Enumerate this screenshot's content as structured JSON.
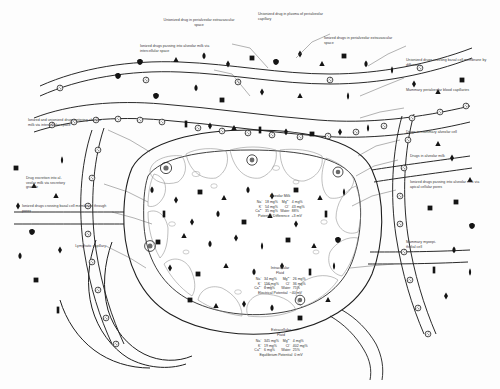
{
  "figure": {
    "ink": "#1a1a1a",
    "leader": "#4a4a4a",
    "paper": "#fdfdfd"
  },
  "labels": [
    {
      "id": "unionized-perialveolar-extravascular",
      "text": "Unionized drug in perialveolar extravascular space"
    },
    {
      "id": "ionized-intercellular",
      "text": "Ionized drugs passing into alveolar milk via intercellular space"
    },
    {
      "id": "unionized-plasma-capillary",
      "text": "Unionized drug in plasma of perialveolar capillary"
    },
    {
      "id": "ionized-perialveolar-extravascular",
      "text": "Ionized drugs in perialveolar extravascular space"
    },
    {
      "id": "unionized-basal-diffusion",
      "text": "Unionized drugs crossing basal cell membrane by diffusion"
    },
    {
      "id": "mammary-blood-capillaries",
      "text": "Mammary perialveolar blood capillaries"
    },
    {
      "id": "drugs-mammary-alveolar-cell",
      "text": "Drugs in mammary alveolar cell"
    },
    {
      "id": "drugs-alveolar-milk",
      "text": "Drugs in alveolar milk"
    },
    {
      "id": "ionized-apical-pores",
      "text": "Ionized drugs passing into alveolar milk via apical cellular pores"
    },
    {
      "id": "mammary-myoepithelial-cell",
      "text": "Mammary myoepi-\nthelial cell"
    },
    {
      "id": "ionized-unionized-intercellular",
      "text": "Ionized and unionized drugs entering alveolar milk via intercellular space"
    },
    {
      "id": "drug-secretion-granule",
      "text": "Drug excretion into al-\nveolar milk via secretory\ngranule"
    },
    {
      "id": "ionized-basal-pores",
      "text": "Ionized drugs crossing basal cell membrane through pores"
    },
    {
      "id": "lymphatic-capillary",
      "text": "Lymphatic capillary"
    }
  ],
  "compartments": [
    {
      "id": "alveolar-milk",
      "title": "Alveolar Milk",
      "ions": [
        {
          "name": "Na",
          "charge": "+",
          "value": "18 mg%"
        },
        {
          "name": "Mg",
          "charge": "2+",
          "value": "4 mg%"
        },
        {
          "name": "K",
          "charge": "+",
          "value": "54 mg%"
        },
        {
          "name": "Cl",
          "charge": "−",
          "value": "43 mg%"
        },
        {
          "name": "Ca",
          "charge": "2+",
          "value": "35 mg%"
        },
        {
          "name": "Water",
          "charge": "",
          "value": "88%"
        }
      ],
      "potential_label": "Potential Difference",
      "potential_value": "+3 mV"
    },
    {
      "id": "intracellular-fluid",
      "title": "Intracellular\nFluid",
      "ions": [
        {
          "name": "Na",
          "charge": "+",
          "value": "34 mg%"
        },
        {
          "name": "Mg",
          "charge": "2+",
          "value": "26 mg%"
        },
        {
          "name": "K",
          "charge": "+",
          "value": "156 mg%"
        },
        {
          "name": "Cl",
          "charge": "−",
          "value": "36 mg%"
        },
        {
          "name": "Ca",
          "charge": "2+",
          "value": "6 mg%"
        },
        {
          "name": "Water",
          "charge": "",
          "value": "75%"
        }
      ],
      "potential_label": "Electrical Potential",
      "potential_value": "−40 mV"
    },
    {
      "id": "extracellular-fluid",
      "title": "Extracellular\nFluid",
      "ions": [
        {
          "name": "Na",
          "charge": "+",
          "value": "345 mg%"
        },
        {
          "name": "Mg",
          "charge": "2+",
          "value": "4 mg%"
        },
        {
          "name": "K",
          "charge": "+",
          "value": "19 mg%"
        },
        {
          "name": "Cl",
          "charge": "−",
          "value": "402 mg%"
        },
        {
          "name": "Ca",
          "charge": "2+",
          "value": "6 mg%"
        },
        {
          "name": "Water",
          "charge": "",
          "value": "25%"
        }
      ],
      "potential_label": "Equilibrium Potential",
      "potential_value": "0 mV"
    }
  ],
  "symbol_legend": [
    {
      "id": "circle-nucleus",
      "shape": "circle-textured",
      "meaning": "cell nucleus"
    },
    {
      "id": "triangle",
      "shape": "triangle",
      "meaning": "drug molecule form A"
    },
    {
      "id": "diamond",
      "shape": "diamond",
      "meaning": "drug molecule form B"
    },
    {
      "id": "square",
      "shape": "square",
      "meaning": "drug molecule form C"
    },
    {
      "id": "teardrop",
      "shape": "teardrop",
      "meaning": "drug molecule form D"
    },
    {
      "id": "lens",
      "shape": "lens",
      "meaning": "drug molecule form E"
    }
  ]
}
